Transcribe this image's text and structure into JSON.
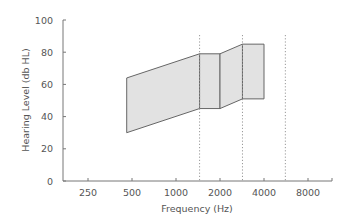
{
  "chart_data": {
    "type": "area",
    "title": "",
    "xlabel": "Frequency (Hz)",
    "ylabel": "Hearing Level (db HL)",
    "xscale": "log2",
    "x_ticks": [
      250,
      500,
      1000,
      2000,
      4000,
      8000
    ],
    "x_tick_labels": [
      "250",
      "500",
      "1000",
      "2000",
      "4000",
      "8000"
    ],
    "y_ticks": [
      0,
      20,
      40,
      60,
      80,
      100
    ],
    "y_tick_labels": [
      "0",
      "20",
      "40",
      "60",
      "80",
      "100"
    ],
    "ylim": [
      0,
      100
    ],
    "grid": false,
    "legend": null,
    "shaded_regions": [
      {
        "name": "region-1",
        "x": [
          460,
          1450
        ],
        "top": [
          64,
          79
        ],
        "bottom": [
          30,
          45
        ]
      },
      {
        "name": "region-2",
        "x": [
          1450,
          2000
        ],
        "top": [
          79,
          79
        ],
        "bottom": [
          45,
          45
        ]
      },
      {
        "name": "region-3",
        "x": [
          2000,
          2850
        ],
        "top": [
          79,
          85
        ],
        "bottom": [
          45,
          51
        ]
      },
      {
        "name": "region-4",
        "x": [
          2850,
          4000
        ],
        "top": [
          85,
          85
        ],
        "bottom": [
          51,
          51
        ]
      }
    ],
    "vertical_dotted_lines": [
      1450,
      2850,
      5600
    ],
    "fill_color": "#e2e2e2",
    "stroke_color": "#666666"
  }
}
